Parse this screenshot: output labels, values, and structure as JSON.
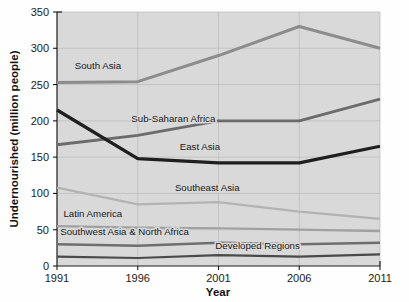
{
  "chart_data": {
    "type": "line",
    "title": "",
    "xlabel": "Year",
    "ylabel": "Undernourished (million people)",
    "x": [
      1991,
      1996,
      2001,
      2006,
      2011
    ],
    "xtick_labels": [
      "1991",
      "1996",
      "2001",
      "2006",
      "2011"
    ],
    "ytick_labels": [
      "0",
      "50",
      "100",
      "150",
      "200",
      "250",
      "300",
      "350"
    ],
    "yticks": [
      0,
      50,
      100,
      150,
      200,
      250,
      300,
      350
    ],
    "ylim": [
      0,
      350
    ],
    "xlim": [
      1991,
      2011
    ],
    "grid": true,
    "legend_position": "inline-labels",
    "plot_background": "#d9d9d9",
    "series": [
      {
        "name": "South Asia",
        "label": "South Asia",
        "color": "#8c8c8c",
        "width": 3.0,
        "values": [
          253,
          254,
          290,
          330,
          300
        ],
        "label_x": 1992.1,
        "label_y": 272
      },
      {
        "name": "Sub-Saharan Africa",
        "label": "Sub-Saharan Africa",
        "color": "#6b6b6b",
        "width": 2.9,
        "values": [
          167,
          180,
          200,
          200,
          230
        ],
        "label_x": 1995.6,
        "label_y": 199
      },
      {
        "name": "East Asia",
        "label": "East Asia",
        "color": "#1f1f1f",
        "width": 3.3,
        "values": [
          215,
          148,
          142,
          142,
          165
        ],
        "label_x": 1998.6,
        "label_y": 160
      },
      {
        "name": "Southeast Asia",
        "label": "Southeast Asia",
        "color": "#b3b3b3",
        "width": 2.3,
        "values": [
          108,
          85,
          88,
          75,
          65
        ],
        "label_x": 1998.3,
        "label_y": 103
      },
      {
        "name": "Latin America",
        "label": "Latin America",
        "color": "#a0a0a0",
        "width": 2.2,
        "values": [
          55,
          53,
          52,
          50,
          48
        ],
        "label_x": 1991.4,
        "label_y": 67
      },
      {
        "name": "Southwest Asia & North Africa",
        "label": "Southwest Asia & North Africa",
        "color": "#6e6e6e",
        "width": 2.4,
        "values": [
          30,
          28,
          32,
          30,
          32
        ],
        "label_x": 1991.2,
        "label_y": 43
      },
      {
        "name": "Developed Regions",
        "label": "Developed Regions",
        "color": "#4a4a4a",
        "width": 2.2,
        "values": [
          13,
          11,
          15,
          13,
          16
        ],
        "label_x": 2000.8,
        "label_y": 23
      }
    ]
  }
}
